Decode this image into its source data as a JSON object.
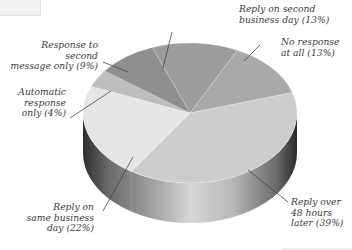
{
  "chart_data": {
    "type": "pie",
    "title": "",
    "style": "3d",
    "categories": [
      "Reply on second business day",
      "No response at all",
      "Reply over 48 hours later",
      "Reply on same business day",
      "Automatic response only",
      "Response to second message only"
    ],
    "values": [
      13,
      13,
      39,
      22,
      4,
      9
    ],
    "unit": "%",
    "colors": [
      "#9c9c9c",
      "#a9a9a9",
      "#cdcdcd",
      "#e6e6e6",
      "#bdbdbd",
      "#8f8f8f"
    ],
    "legend": "none (callout labels)"
  },
  "labels": {
    "second_day": "Reply on second\nbusiness day (13%)",
    "no_response": "No response\nat all (13%)",
    "over_48": "Reply over\n48 hours\nlater (39%)",
    "same_day": "Reply on\nsame business\nday (22%)",
    "automatic": "Automatic\nresponse\nonly (4%)",
    "second_message": "Response to second\nmessage only (9%)"
  }
}
